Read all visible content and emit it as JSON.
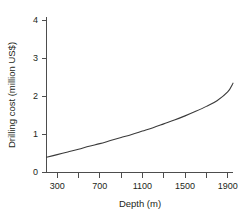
{
  "chart_data": {
    "type": "line",
    "title": "",
    "xlabel": "Depth (m)",
    "ylabel": "Drilling cost (million US$)",
    "xlim": [
      200,
      1950
    ],
    "ylim": [
      0,
      4
    ],
    "grid": false,
    "legend": null,
    "x_major_ticks": [
      300,
      700,
      1100,
      1500,
      1900
    ],
    "x_minor_ticks": [
      500,
      900,
      1300,
      1700
    ],
    "x_tick_labels": [
      "300",
      "700",
      "1100",
      "1500",
      "1900"
    ],
    "y_ticks": [
      0,
      1,
      2,
      3,
      4
    ],
    "y_tick_labels": [
      "0",
      "1",
      "2",
      "3",
      "4"
    ],
    "series": [
      {
        "name": "Drilling cost",
        "color": "#3a3a3a",
        "x": [
          200,
          300,
          400,
          500,
          600,
          700,
          800,
          900,
          1000,
          1100,
          1200,
          1300,
          1400,
          1500,
          1600,
          1700,
          1800,
          1900,
          1950
        ],
        "values": [
          0.4,
          0.47,
          0.54,
          0.61,
          0.69,
          0.76,
          0.84,
          0.92,
          1.0,
          1.09,
          1.18,
          1.28,
          1.38,
          1.49,
          1.61,
          1.74,
          1.89,
          2.12,
          2.35
        ]
      }
    ]
  },
  "colors": {
    "background": "#ffffff",
    "axis": "#4d4d4d",
    "curve": "#3a3a3a",
    "text": "#231f20"
  }
}
